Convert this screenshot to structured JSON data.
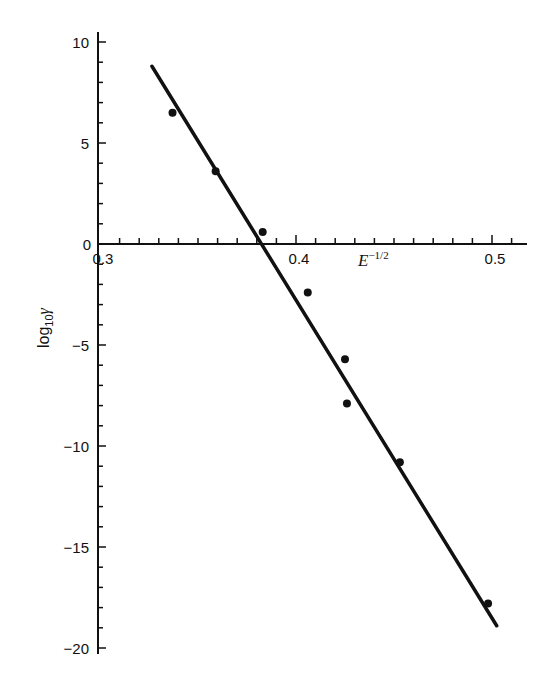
{
  "chart_data": {
    "type": "scatter",
    "title": "",
    "xlabel": "E^{-1/2}",
    "xlabel_main": "E",
    "xlabel_sup": "−1/2",
    "ylabel": "log10 γ",
    "ylabel_main": "log",
    "ylabel_sub": "10",
    "ylabel_sym": "γ",
    "xlim": [
      0.3,
      0.52
    ],
    "ylim": [
      -20,
      10.5
    ],
    "grid": false,
    "legend": null,
    "x_ticks": [
      0.3,
      0.4,
      0.5
    ],
    "x_tick_labels": [
      "0.3",
      "0.4",
      "0.5"
    ],
    "y_ticks": [
      10,
      5,
      0,
      -5,
      -10,
      -15,
      -20
    ],
    "y_tick_labels": [
      "10",
      "5",
      "0",
      "−5",
      "−10",
      "−15",
      "−20"
    ],
    "series": [
      {
        "name": "data",
        "kind": "points",
        "x": [
          0.337,
          0.359,
          0.383,
          0.406,
          0.425,
          0.426,
          0.453,
          0.498
        ],
        "y": [
          6.5,
          3.6,
          0.6,
          -2.4,
          -5.7,
          -7.9,
          -10.8,
          -17.8
        ]
      },
      {
        "name": "linear fit",
        "kind": "line",
        "x": [
          0.3265,
          0.5024
        ],
        "y": [
          8.8,
          -18.9
        ]
      }
    ]
  }
}
